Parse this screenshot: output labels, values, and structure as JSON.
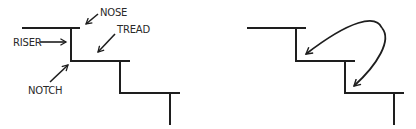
{
  "diagram": {
    "type": "staircase-anatomy",
    "left_panel": {
      "description": "Labeled stair profile",
      "labels": {
        "nose": "NOSE",
        "tread": "TREAD",
        "riser": "RISER",
        "notch": "NOTCH"
      }
    },
    "right_panel": {
      "description": "Stair profile with curved arrows showing movement from one step down to the next"
    },
    "colors": {
      "line": "#1e1e1e",
      "background": "#ffffff"
    }
  }
}
